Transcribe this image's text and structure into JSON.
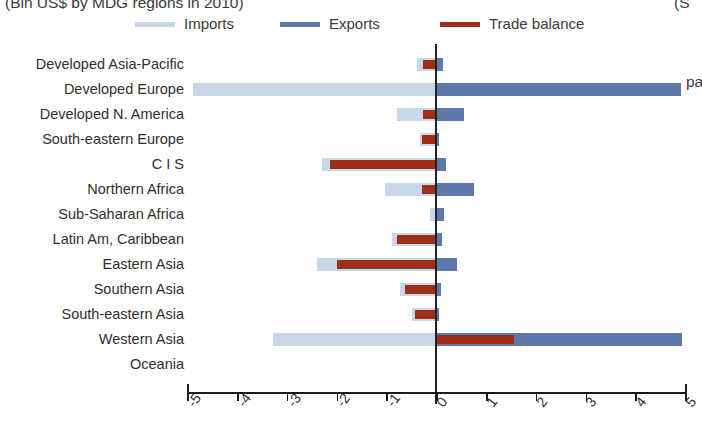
{
  "title": {
    "text": "(Bln US$ by MDG regions in 2010)",
    "right_fragment": "(S"
  },
  "right_annotation": "pa",
  "legend": {
    "position": "top",
    "items": [
      {
        "label": "Imports",
        "color": "#c9d6e8",
        "icon": "line-swatch-icon",
        "x": 135
      },
      {
        "label": "Exports",
        "color": "#5f78ab",
        "icon": "line-swatch-icon",
        "x": 280
      },
      {
        "label": "Trade balance",
        "color": "#9e2f16",
        "icon": "line-swatch-icon",
        "x": 440
      }
    ]
  },
  "axis": {
    "x_ticks": [
      "-5",
      "-4",
      "-3",
      "-2",
      "-1",
      "0",
      "1",
      "2",
      "3",
      "4",
      "5"
    ],
    "x_min": -5,
    "x_max": 5,
    "zero_label": "0"
  },
  "chart_data": {
    "type": "bar",
    "orientation": "horizontal",
    "title": "(Bln US$ by MDG regions in 2010)",
    "xlabel": "",
    "ylabel": "",
    "xlim": [
      -5,
      5
    ],
    "grid": false,
    "legend_position": "top",
    "categories": [
      "Developed Asia-Pacific",
      "Developed Europe",
      "Developed N. America",
      "South-eastern Europe",
      "C I S",
      "Northern Africa",
      "Sub-Saharan Africa",
      "Latin Am, Caribbean",
      "Eastern Asia",
      "Southern Asia",
      "South-eastern Asia",
      "Western Asia",
      "Oceania"
    ],
    "series": [
      {
        "name": "Imports",
        "color": "#c9d6e8",
        "values": [
          -0.4,
          -4.9,
          -0.8,
          -0.35,
          -2.3,
          -1.05,
          -0.15,
          -0.9,
          -2.4,
          -0.75,
          -0.5,
          -3.3,
          0.0
        ]
      },
      {
        "name": "Exports",
        "color": "#5f78ab",
        "values": [
          0.12,
          4.9,
          0.55,
          0.05,
          0.18,
          0.75,
          0.15,
          0.1,
          0.4,
          0.08,
          0.04,
          4.92,
          0.0
        ]
      },
      {
        "name": "Trade balance",
        "color": "#9e2f16",
        "values": [
          -0.28,
          -0.05,
          -0.28,
          -0.3,
          -2.15,
          -0.3,
          0.0,
          -0.8,
          -2.0,
          -0.65,
          -0.45,
          1.55,
          0.0
        ]
      }
    ]
  }
}
